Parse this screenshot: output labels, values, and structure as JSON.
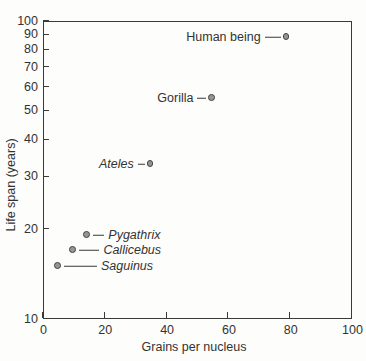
{
  "figure": {
    "background": "#fdfdfb",
    "axis_color": "#3a3a3a",
    "text_color": "#333333",
    "point_fill": "#969696",
    "point_stroke": "#414141"
  },
  "chart_data": {
    "type": "scatter",
    "title": "",
    "xlabel": "Grains per nucleus",
    "ylabel": "Life span (years)",
    "xlim": [
      0,
      100
    ],
    "ylim": [
      10,
      100
    ],
    "x_scale": "linear",
    "y_scale": "log",
    "x_ticks": [
      0,
      20,
      40,
      60,
      80,
      100
    ],
    "y_ticks": [
      10,
      20,
      30,
      40,
      50,
      60,
      70,
      80,
      90,
      100
    ],
    "grid": false,
    "legend": false,
    "points": [
      {
        "label": "Human being",
        "x": 79,
        "y": 88,
        "italic": false,
        "label_side": "left",
        "leader_px": 16
      },
      {
        "label": "Gorilla",
        "x": 55,
        "y": 55,
        "italic": false,
        "label_side": "left",
        "leader_px": 9
      },
      {
        "label": "Ateles",
        "x": 35,
        "y": 33,
        "italic": true,
        "label_side": "left",
        "leader_px": 7
      },
      {
        "label": "Pygathrix",
        "x": 14.5,
        "y": 19,
        "italic": true,
        "label_side": "right",
        "leader_px": 11
      },
      {
        "label": "Callicebus",
        "x": 10,
        "y": 17,
        "italic": true,
        "label_side": "right",
        "leader_px": 20
      },
      {
        "label": "Saguinus",
        "x": 5,
        "y": 15,
        "italic": true,
        "label_side": "right",
        "leader_px": 33
      }
    ]
  }
}
